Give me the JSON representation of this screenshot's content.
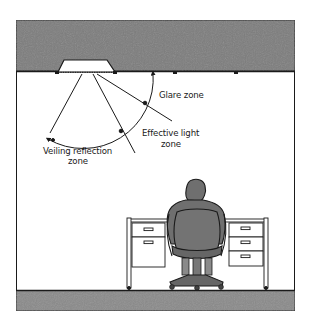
{
  "diagram": {
    "colors": {
      "ceiling_fill": "#7d7d7d",
      "floor_fill": "#8a8a8a",
      "outline": "#1a1a1a",
      "figure_fill": "#6f6f6f",
      "background": "#ffffff"
    },
    "labels": {
      "glare_zone": "Glare zone",
      "effective_light_line1": "Effective light",
      "effective_light_line2": "zone",
      "veiling_reflection_line1": "Veiling reflection",
      "veiling_reflection_line2": "zone"
    },
    "elements": {
      "ceiling": "ceiling",
      "floor": "floor",
      "light_fixture": "recessed-light-fixture",
      "person": "seated-worker",
      "chair": "office-chair",
      "desk": "double-pedestal-desk",
      "desk_left_drawers": 2,
      "desk_right_drawers": 3
    }
  }
}
